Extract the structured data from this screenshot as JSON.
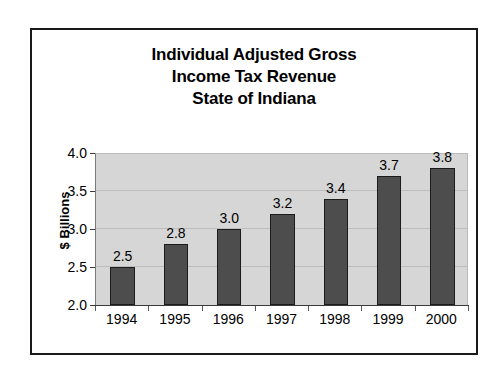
{
  "chart_data": {
    "type": "bar",
    "title": "Individual Adjusted Gross Income Tax Revenue State of Indiana",
    "title_lines": [
      "Individual Adjusted Gross",
      "Income Tax Revenue",
      "State of Indiana"
    ],
    "categories": [
      "1994",
      "1995",
      "1996",
      "1997",
      "1998",
      "1999",
      "2000"
    ],
    "values": [
      2.5,
      2.8,
      3.0,
      3.2,
      3.4,
      3.7,
      3.8
    ],
    "value_labels": [
      "2.5",
      "2.8",
      "3.0",
      "3.2",
      "3.4",
      "3.7",
      "3.8"
    ],
    "xlabel": "",
    "ylabel": "$ Billions",
    "ylim": [
      2.0,
      4.0
    ],
    "ytick_values": [
      2.0,
      2.5,
      3.0,
      3.5,
      4.0
    ],
    "ytick_labels": [
      "2.0",
      "2.5",
      "3.0",
      "3.5",
      "4.0"
    ],
    "grid": true,
    "legend": false,
    "colors": {
      "bar_fill": "#4d4d4d",
      "bar_edge": "#1c1c1c",
      "plot_background": "#d6d6d6",
      "gridline": "#bdbdbd",
      "frame": "#1a1a1a",
      "text": "#000000"
    }
  }
}
